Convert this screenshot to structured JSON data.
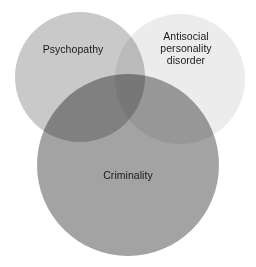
{
  "diagram": {
    "type": "venn",
    "title": "",
    "background_color": "#ffffff",
    "sets": [
      {
        "id": "psychopathy",
        "label": "Psychopathy",
        "color": "#c9c9c9",
        "position": "top-left",
        "cx": 80,
        "cy": 77,
        "r": 65
      },
      {
        "id": "antisocial_personality_disorder",
        "label": "Antisocial\npersonality\ndisorder",
        "color": "#ececec",
        "position": "top-right",
        "cx": 180,
        "cy": 79,
        "r": 65
      },
      {
        "id": "criminality",
        "label": "Criminality",
        "color": "#a3a3a3",
        "position": "bottom-center",
        "cx": 128,
        "cy": 165,
        "r": 91
      }
    ],
    "text_color": "#1a1a1a"
  }
}
